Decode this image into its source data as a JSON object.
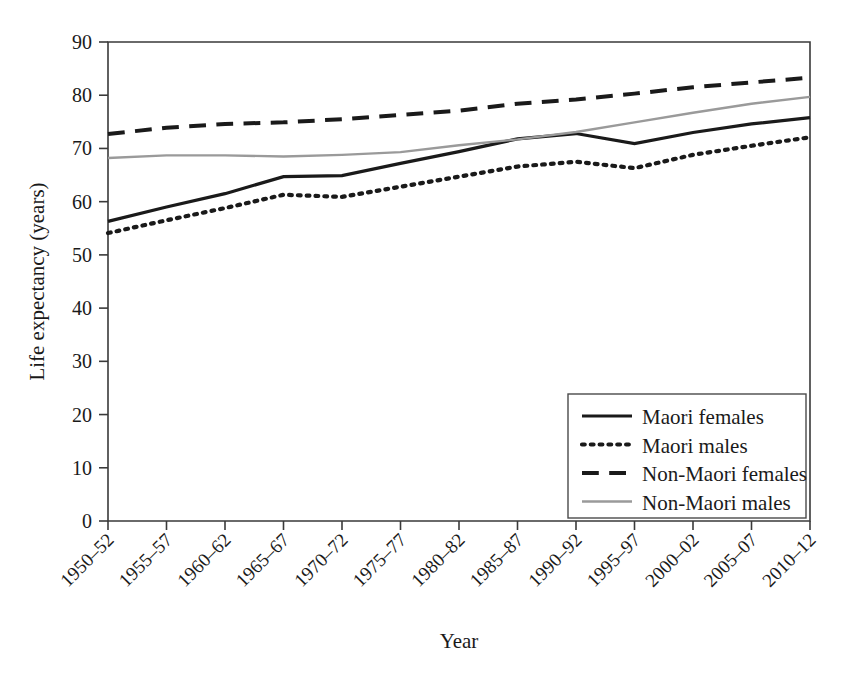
{
  "chart_data": {
    "type": "line",
    "title": "",
    "xlabel": "Year",
    "ylabel": "Life expectancy (years)",
    "ylim": [
      0,
      90
    ],
    "ytick_step": 10,
    "yticks": [
      "0",
      "10",
      "20",
      "30",
      "40",
      "50",
      "60",
      "70",
      "80",
      "90"
    ],
    "grid": false,
    "legend_position": "bottom-right",
    "categories": [
      "1950–52",
      "1955–57",
      "1960–62",
      "1965–67",
      "1970–72",
      "1975–77",
      "1980–82",
      "1985–87",
      "1990–92",
      "1995–97",
      "2000–02",
      "2005–07",
      "2010–12"
    ],
    "series": [
      {
        "name": "Maori females",
        "style": "solid",
        "color": "#1a1a1a",
        "values": [
          56.3,
          59.0,
          61.5,
          64.7,
          64.9,
          67.2,
          69.4,
          71.8,
          72.8,
          70.9,
          73.0,
          74.6,
          75.8
        ]
      },
      {
        "name": "Maori males",
        "style": "dotted",
        "color": "#1a1a1a",
        "values": [
          54.1,
          56.5,
          58.8,
          61.3,
          60.9,
          62.8,
          64.7,
          66.6,
          67.5,
          66.3,
          68.8,
          70.5,
          72.1
        ]
      },
      {
        "name": "Non-Maori females",
        "style": "dashed",
        "color": "#1a1a1a",
        "values": [
          72.7,
          73.9,
          74.6,
          74.9,
          75.5,
          76.3,
          77.1,
          78.4,
          79.2,
          80.3,
          81.5,
          82.4,
          83.3
        ]
      },
      {
        "name": "Non-Maori males",
        "style": "solid",
        "color": "#9a9a9a",
        "values": [
          68.2,
          68.7,
          68.7,
          68.5,
          68.8,
          69.3,
          70.6,
          71.7,
          73.1,
          74.9,
          76.7,
          78.4,
          79.7
        ]
      }
    ]
  },
  "legend": {
    "items": [
      {
        "label": "Maori females"
      },
      {
        "label": "Maori males"
      },
      {
        "label": "Non-Maori females"
      },
      {
        "label": "Non-Maori males"
      }
    ]
  }
}
